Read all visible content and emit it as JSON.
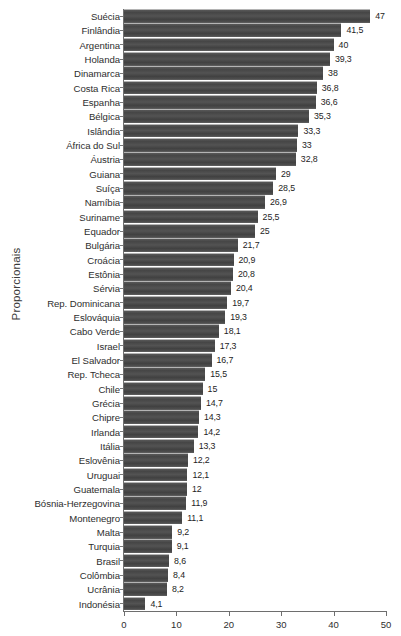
{
  "chart_data": {
    "type": "bar",
    "orientation": "horizontal",
    "title": "",
    "xlabel": "",
    "ylabel": "Proporcionais",
    "xlim": [
      0,
      50
    ],
    "xticks": [
      0,
      10,
      20,
      30,
      40,
      50
    ],
    "xtick_labels": [
      "0",
      "10",
      "20",
      "30",
      "40",
      "50"
    ],
    "grid": false,
    "legend": null,
    "decimal_separator": ",",
    "bar_color": "#4c4c4c",
    "categories": [
      "Suécia",
      "Finlândia",
      "Argentina",
      "Holanda",
      "Dinamarca",
      "Costa Rica",
      "Espanha",
      "Bélgica",
      "Islândia",
      "África do Sul",
      "Áustria",
      "Guiana",
      "Suíça",
      "Namíbia",
      "Suriname",
      "Equador",
      "Bulgária",
      "Croácia",
      "Estônia",
      "Sérvia",
      "Rep. Dominicana",
      "Eslováquia",
      "Cabo Verde",
      "Israel",
      "El Salvador",
      "Rep. Tcheca",
      "Chile",
      "Grécia",
      "Chipre",
      "Irlanda",
      "Itália",
      "Eslovênia",
      "Uruguai",
      "Guatemala",
      "Bósnia-Herzegovina",
      "Montenegro",
      "Malta",
      "Turquia",
      "Brasil",
      "Colômbia",
      "Ucrânia",
      "Indonésia"
    ],
    "values": [
      47,
      41.5,
      40,
      39.3,
      38,
      36.8,
      36.6,
      35.3,
      33.3,
      33,
      32.8,
      29,
      28.5,
      26.9,
      25.5,
      25,
      21.7,
      20.9,
      20.8,
      20.4,
      19.7,
      19.3,
      18.1,
      17.3,
      16.7,
      15.5,
      15,
      14.7,
      14.3,
      14.2,
      13.3,
      12.2,
      12.1,
      12,
      11.9,
      11.1,
      9.2,
      9.1,
      8.6,
      8.4,
      8.2,
      4.1
    ],
    "value_labels": [
      "47",
      "41,5",
      "40",
      "39,3",
      "38",
      "36,8",
      "36,6",
      "35,3",
      "33,3",
      "33",
      "32,8",
      "29",
      "28,5",
      "26,9",
      "25,5",
      "25",
      "21,7",
      "20,9",
      "20,8",
      "20,4",
      "19,7",
      "19,3",
      "18,1",
      "17,3",
      "16,7",
      "15,5",
      "15",
      "14,7",
      "14,3",
      "14,2",
      "13,3",
      "12,2",
      "12,1",
      "12",
      "11,9",
      "11,1",
      "9,2",
      "9,1",
      "8,6",
      "8,4",
      "8,2",
      "4,1"
    ]
  }
}
